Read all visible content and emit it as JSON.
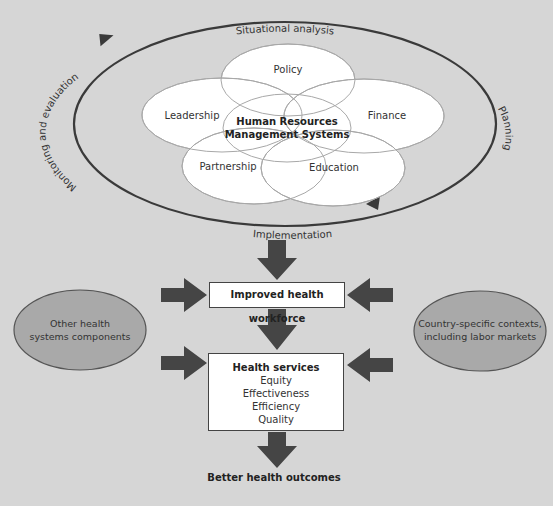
{
  "diagram": {
    "type": "flow-diagram",
    "cycle": {
      "stages": [
        {
          "id": "situational-analysis",
          "label": "Situational analysis"
        },
        {
          "id": "planning",
          "label": "Planning"
        },
        {
          "id": "implementation",
          "label": "Implementation"
        },
        {
          "id": "monitoring-evaluation",
          "label": "Monitoring and evaluation"
        }
      ]
    },
    "core": {
      "center_label_line1": "Human Resources",
      "center_label_line2": "Management Systems",
      "petals": [
        {
          "id": "policy",
          "label": "Policy"
        },
        {
          "id": "leadership",
          "label": "Leadership"
        },
        {
          "id": "finance",
          "label": "Finance"
        },
        {
          "id": "partnership",
          "label": "Partnership"
        },
        {
          "id": "education",
          "label": "Education"
        }
      ]
    },
    "workforce_box": {
      "label": "Improved health workforce"
    },
    "services_box": {
      "title": "Health services",
      "items": [
        "Equity",
        "Effectiveness",
        "Efficiency",
        "Quality"
      ]
    },
    "left_input": {
      "line1": "Other health",
      "line2": "systems components"
    },
    "right_input": {
      "line1": "Country-specific contexts,",
      "line2": "including labor markets"
    },
    "outcome": {
      "label": "Better health outcomes"
    },
    "colors": {
      "background": "#d6d6d6",
      "ellipse_fill": "#ffffff",
      "ellipse_stroke": "#a8a8a8",
      "cycle_stroke": "#3a3a3a",
      "arrow_fill": "#454545",
      "oval_fill": "#a9a9a9",
      "oval_stroke": "#555555",
      "box_stroke": "#444444"
    }
  }
}
